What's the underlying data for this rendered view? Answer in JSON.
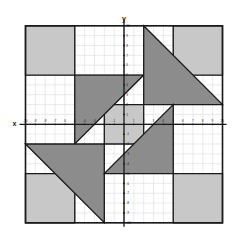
{
  "figure": {
    "axis_labels": {
      "x": "x",
      "y": "y"
    },
    "colors": {
      "background": "#ffffff",
      "light_shape": "#c8c8c8",
      "dark_shape": "#8c8c8c",
      "outline": "#1a1a1a",
      "axis": "#1a1a1a",
      "minor_grid": "#dcdcdc",
      "major_grid": "#9a9a9a",
      "frame": "#1a1a1a",
      "tick_label": "#1a1a1a"
    }
  },
  "chart_data": {
    "type": "scatter",
    "title": "",
    "xlabel": "x",
    "ylabel": "y",
    "xlim": [
      -10,
      10
    ],
    "ylim": [
      -10,
      10
    ],
    "grid": true,
    "minor_grid_step": 1,
    "major_grid_step": 5,
    "legend": "none",
    "x_tick_labels": [
      "-10",
      "-9",
      "-8",
      "-7",
      "-6",
      "-5",
      "-4",
      "-3",
      "-2",
      "-1",
      "1",
      "2",
      "3",
      "4",
      "5",
      "6",
      "7",
      "8",
      "9",
      "10"
    ],
    "y_tick_labels": [
      "10",
      "9",
      "8",
      "7",
      "6",
      "5",
      "4",
      "3",
      "2",
      "1",
      "-1",
      "-2",
      "-3",
      "-4",
      "-5",
      "-6",
      "-7",
      "-8",
      "-9",
      "-10"
    ],
    "shapes": [
      {
        "name": "square-top-left",
        "kind": "polygon",
        "fill": "light",
        "points": [
          [
            -10,
            10
          ],
          [
            -5,
            10
          ],
          [
            -5,
            5
          ],
          [
            -10,
            5
          ]
        ]
      },
      {
        "name": "square-top-right",
        "kind": "polygon",
        "fill": "light",
        "points": [
          [
            5,
            10
          ],
          [
            10,
            10
          ],
          [
            10,
            5
          ],
          [
            5,
            5
          ]
        ]
      },
      {
        "name": "square-bottom-left",
        "kind": "polygon",
        "fill": "light",
        "points": [
          [
            -10,
            -5
          ],
          [
            -5,
            -5
          ],
          [
            -5,
            -10
          ],
          [
            -10,
            -10
          ]
        ]
      },
      {
        "name": "square-bottom-right",
        "kind": "polygon",
        "fill": "light",
        "points": [
          [
            5,
            -5
          ],
          [
            10,
            -5
          ],
          [
            10,
            -10
          ],
          [
            5,
            -10
          ]
        ]
      },
      {
        "name": "square-center",
        "kind": "polygon",
        "fill": "light",
        "points": [
          [
            -2,
            2
          ],
          [
            2,
            2
          ],
          [
            2,
            -2
          ],
          [
            -2,
            -2
          ]
        ]
      },
      {
        "name": "triangle-upper-left",
        "kind": "polygon",
        "fill": "dark",
        "points": [
          [
            -5,
            5
          ],
          [
            2,
            5
          ],
          [
            -5,
            -2
          ]
        ]
      },
      {
        "name": "triangle-upper-right",
        "kind": "polygon",
        "fill": "dark",
        "points": [
          [
            2,
            10
          ],
          [
            10,
            2
          ],
          [
            2,
            2
          ]
        ]
      },
      {
        "name": "triangle-lower-left",
        "kind": "polygon",
        "fill": "dark",
        "points": [
          [
            -10,
            -2
          ],
          [
            -2,
            -10
          ],
          [
            -2,
            -2
          ]
        ]
      },
      {
        "name": "triangle-lower-right",
        "kind": "polygon",
        "fill": "dark",
        "points": [
          [
            5,
            -5
          ],
          [
            5,
            2
          ],
          [
            -2,
            -5
          ]
        ]
      }
    ]
  }
}
